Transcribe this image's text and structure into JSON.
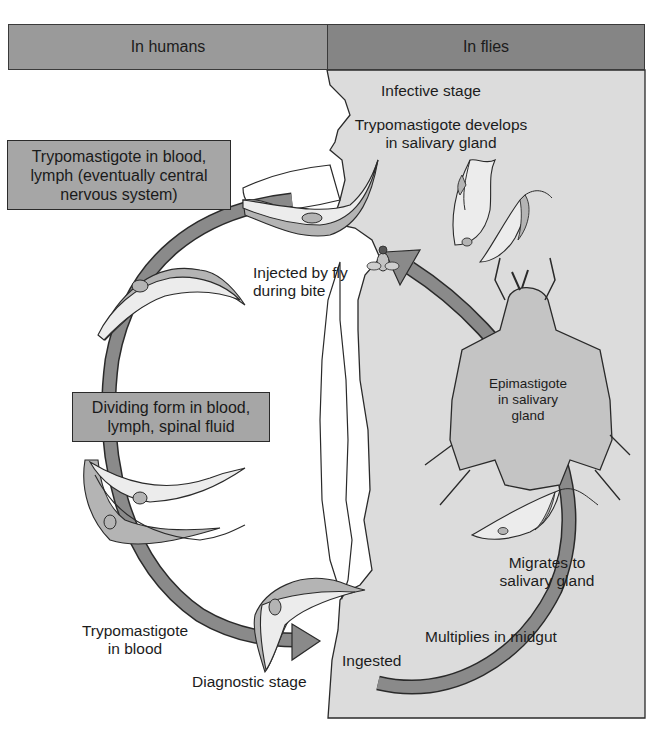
{
  "header": {
    "left_label": "In humans",
    "right_label": "In flies"
  },
  "colors": {
    "header_left": "#9a9a9a",
    "header_right": "#858585",
    "fly_panel": "#dcdcdc",
    "cycle_arrow": "#8a8a8a",
    "box_fill": "#a6a6a6",
    "organism_light": "#ececec",
    "organism_membrane": "#b4b4b4",
    "fly_body": "#c4c4c4"
  },
  "human_side": {
    "box_top": {
      "lines": [
        "Trypomastigote in blood,",
        "lymph (eventually central",
        "nervous system)"
      ]
    },
    "box_middle": {
      "lines": [
        "Dividing form in blood,",
        "lymph, spinal fluid"
      ]
    },
    "injected_label": {
      "lines": [
        "Injected by fly",
        "during bite"
      ]
    },
    "trypomastigote_blood_label": {
      "lines": [
        "Trypomastigote",
        "in blood"
      ]
    },
    "diagnostic_label": "Diagnostic stage"
  },
  "fly_side": {
    "infective_label": "Infective stage",
    "develops_label": {
      "lines": [
        "Trypomastigote develops",
        "in salivary gland"
      ]
    },
    "epimastigote_label": {
      "lines": [
        "Epimastigote",
        "in salivary",
        "gland"
      ]
    },
    "migrates_label": {
      "lines": [
        "Migrates to",
        "salivary gland"
      ]
    },
    "multiplies_label": "Multiplies in midgut",
    "ingested_label": "Ingested"
  },
  "icons": {
    "tsetse_fly_large": "fly-silhouette",
    "tsetse_fly_small": "fly-biting",
    "cycle_arrows": "curved-arrow"
  }
}
